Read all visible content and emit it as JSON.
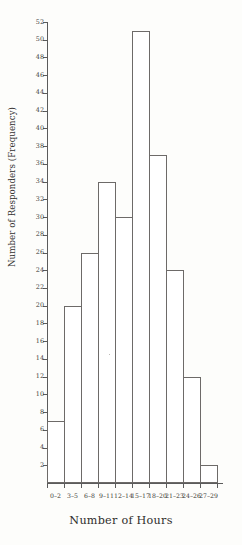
{
  "chart_data": {
    "type": "bar",
    "title": "",
    "xlabel": "Number of Hours",
    "ylabel": "Number of Responders (Frequency)",
    "categories": [
      "0–2",
      "3–5",
      "6–8",
      "9–11",
      "12–14",
      "15–17",
      "18–20",
      "21–23",
      "24–26",
      "27–29"
    ],
    "values": [
      7,
      20,
      26,
      34,
      30,
      51,
      37,
      24,
      12,
      2
    ],
    "ylim": [
      0,
      52
    ],
    "ytick_step": 2,
    "ytick_labels": [
      "2",
      "4",
      "6",
      "8",
      "10",
      "12",
      "14",
      "16",
      "18",
      "20",
      "22",
      "24",
      "26",
      "28",
      "30",
      "32",
      "34",
      "36",
      "38",
      "40",
      "42",
      "44",
      "46",
      "48",
      "50",
      "52"
    ],
    "ytick_values": [
      2,
      4,
      6,
      8,
      10,
      12,
      14,
      16,
      18,
      20,
      22,
      24,
      26,
      28,
      30,
      32,
      34,
      36,
      38,
      40,
      42,
      44,
      46,
      48,
      50,
      52
    ],
    "grid": false,
    "legend": false,
    "legend_position": "none",
    "bar_fill": "#ffffff",
    "bar_outline": "#6d6a68",
    "axis_color": "#5b5b5b",
    "background": "#fdfdfb"
  }
}
